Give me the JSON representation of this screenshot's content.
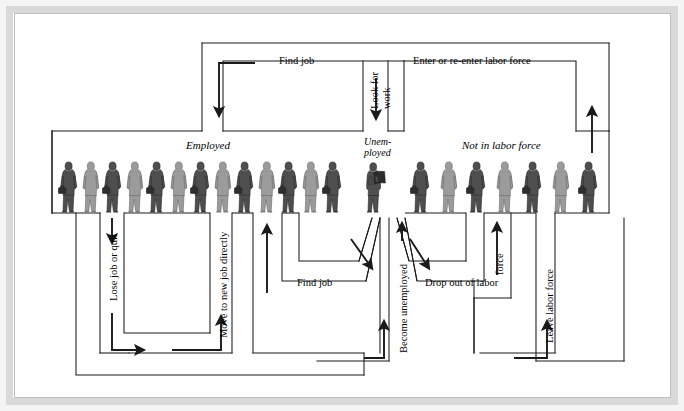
{
  "figure": {
    "type": "flow-diagram",
    "states": {
      "employed": "Employed",
      "unemployed_line1": "Unem-",
      "unemployed_line2": "ployed",
      "unemployed_full": "Unemployed",
      "not_in_labor_force": "Not in labor force"
    },
    "flows": {
      "find_job_top": "Find job",
      "enter_or_reenter": "Enter or re-enter labor force",
      "look_for_work_line1": "Look for",
      "look_for_work_line2": "work",
      "look_for_work_full": "Look for work",
      "lose_job_or_quit": "Lose job or quit",
      "move_to_new_job_directly": "Move to new job directly",
      "find_job_bottom": "Find job",
      "become_unemployed": "Become unemployed",
      "drop_out_of_labor": "Drop out of labor",
      "drop_out_force": "force",
      "drop_out_full": "Drop out of labor force",
      "leave_labor_force": "Leave labor force"
    },
    "people": {
      "employed_count": 13,
      "unemployed_count": 1,
      "not_in_labor_force_count": 7,
      "employed_icon": "person-with-briefcase-icon",
      "unemployed_icon": "person-reading-newspaper-icon",
      "not_in_labor_force_icon": "person-icon"
    },
    "colors": {
      "stroke": "#1a1a1a",
      "figure_dark": "#4a4a4a",
      "figure_light": "#9a9a9a",
      "background": "#ffffff",
      "frame": "#d9d9d9"
    }
  }
}
